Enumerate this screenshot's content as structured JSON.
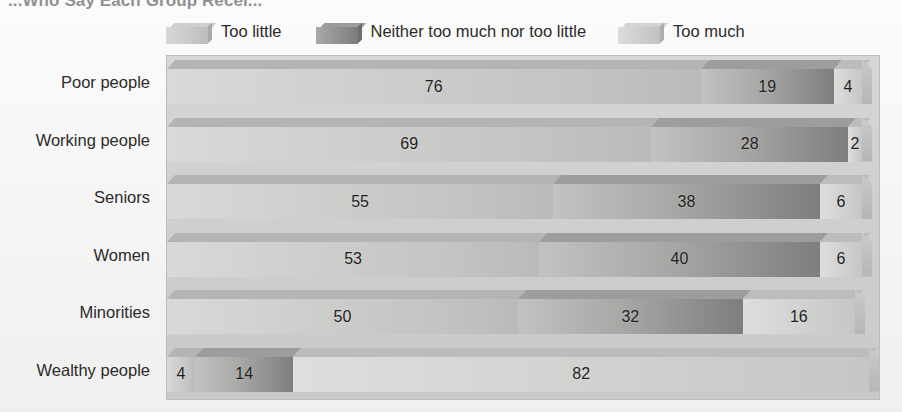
{
  "title": "...Who Say Each Group Recei...",
  "legend": {
    "position": "top",
    "items": [
      {
        "label": "Too little",
        "icon": "legend-swatch-icon",
        "color": "#cfcfcd"
      },
      {
        "label": "Neither too much nor too little",
        "icon": "legend-swatch-icon",
        "color": "#8e8e8c"
      },
      {
        "label": "Too much",
        "icon": "legend-swatch-icon",
        "color": "#d3d3d1"
      }
    ]
  },
  "chart_data": {
    "type": "bar",
    "orientation": "horizontal",
    "stacked": true,
    "title": "...Who Say Each Group Recei...",
    "xlabel": "",
    "ylabel": "",
    "xlim": [
      0,
      100
    ],
    "grid": false,
    "legend_position": "top",
    "categories": [
      "Poor people",
      "Working people",
      "Seniors",
      "Women",
      "Minorities",
      "Wealthy people"
    ],
    "series": [
      {
        "name": "Too little",
        "values": [
          76,
          69,
          55,
          53,
          50,
          4
        ]
      },
      {
        "name": "Neither too much nor too little",
        "values": [
          19,
          28,
          38,
          40,
          32,
          14
        ]
      },
      {
        "name": "Too much",
        "values": [
          4,
          2,
          6,
          6,
          16,
          82
        ]
      }
    ],
    "rows": [
      {
        "category": "Poor people",
        "too_little": 76,
        "neither": 19,
        "too_much": 4
      },
      {
        "category": "Working people",
        "too_little": 69,
        "neither": 28,
        "too_much": 2
      },
      {
        "category": "Seniors",
        "too_little": 55,
        "neither": 38,
        "too_much": 6
      },
      {
        "category": "Women",
        "too_little": 53,
        "neither": 40,
        "too_much": 6
      },
      {
        "category": "Minorities",
        "too_little": 50,
        "neither": 32,
        "too_much": 16
      },
      {
        "category": "Wealthy people",
        "too_little": 4,
        "neither": 14,
        "too_much": 82
      }
    ]
  }
}
